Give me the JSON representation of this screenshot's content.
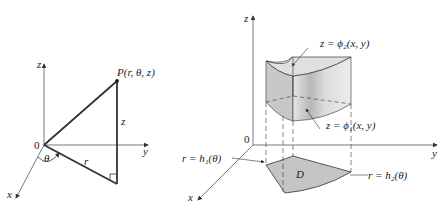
{
  "left_figure": {
    "axes": {
      "z": "z",
      "y": "y",
      "x": "x",
      "origin": "0"
    },
    "point_label": "P(r, θ, z)",
    "side_labels": {
      "height": "z",
      "radius": "r",
      "angle": "θ"
    }
  },
  "right_figure": {
    "axes": {
      "z": "z",
      "y": "y",
      "x": "x",
      "origin": "0"
    },
    "top_surface_label": "z = ϕ₂(x, y)",
    "bottom_surface_label": "z = ϕ₁(x, y)",
    "region_label": "D",
    "inner_boundary_label": "r = h₁(θ)",
    "outer_boundary_label": "r = h₂(θ)"
  },
  "colors": {
    "line": "#333333",
    "solid_fill": "#cfcfcf",
    "solid_fill_dark": "#a9a9a9",
    "region_fill": "#c4c4c4"
  }
}
